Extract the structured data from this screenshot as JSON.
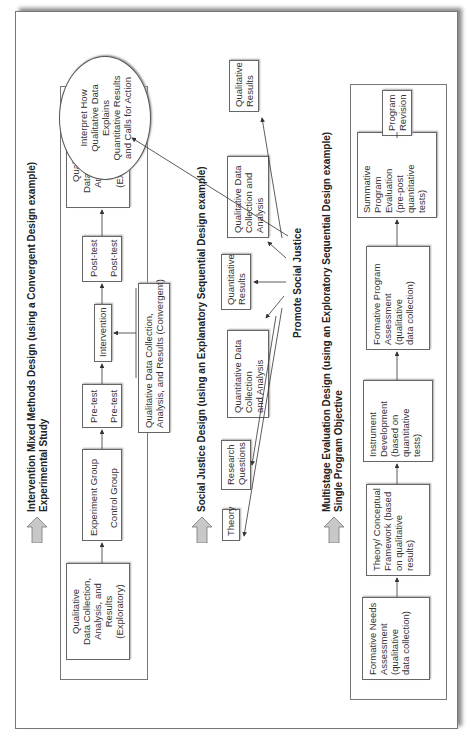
{
  "sections": [
    {
      "id": "intervention",
      "title_line1": "Intervention Mixed Methods Design (using a Convergent Design example)",
      "title_line2": "Experimental Study",
      "boxes": {
        "qual_exploratory": [
          "Qualitative",
          "Data Collection,",
          "Analysis, and",
          "Results",
          "(Exploratory)"
        ],
        "groups": [
          "Experiment Group",
          "Control Group"
        ],
        "pretest": [
          "Pre-test",
          "Pre-test"
        ],
        "intervention": "Intervention",
        "posttest": [
          "Post-test",
          "Post-test"
        ],
        "qual_explanatory": [
          "Qualitative",
          "Data Collection,",
          "Analysis, and",
          "Results",
          "(Explanatory)"
        ],
        "qual_convergent": [
          "Qualitative Data Collection,",
          "Analysis, and Results (Convergent)"
        ]
      }
    },
    {
      "id": "social-justice",
      "title_line1": "Social Justice Design (using an Explanatory Sequential Design example)",
      "boxes": {
        "theory": "Theory",
        "research_questions": [
          "Research",
          "Questions"
        ],
        "quant_data": [
          "Quantitative Data",
          "Collection",
          "and Analysis"
        ],
        "quant_results": [
          "Quantitative",
          "Results"
        ],
        "qual_data": [
          "Qualitative Data",
          "Collection and",
          "Analysis"
        ],
        "qual_results": [
          "Qualitative",
          "Results"
        ],
        "interpret": [
          "Interpret How",
          "Qualitative Data",
          "Explains",
          "Quantitative Results",
          "and Calls for Action"
        ]
      },
      "center_label": "Promote Social Justice"
    },
    {
      "id": "multistage",
      "title_line1": "Multistage Evaluation Design (using an Exploratory Sequential Design example)",
      "title_line2": "Single Program Objective",
      "boxes": {
        "needs": [
          "Formative Needs",
          "Assessment",
          "(qualitative",
          "data collection)"
        ],
        "theory_framework": [
          "Theory/ Conceptual",
          "Framework (based",
          "on qualitative",
          "results)"
        ],
        "instrument": [
          "Instrument",
          "Development",
          "(based on",
          "quantitative",
          "tests)"
        ],
        "formative_program": [
          "Formative Program",
          "Assessment",
          "(qualitative",
          "data collection)"
        ],
        "summative": [
          "Summative",
          "Program",
          "Evaluation",
          "(pre-post",
          "quantitative",
          "tests)"
        ],
        "revision": [
          "Program",
          "Revision"
        ]
      }
    }
  ],
  "colors": {
    "big_arrow_fill": "#c8c8c8",
    "line": "#333333"
  }
}
